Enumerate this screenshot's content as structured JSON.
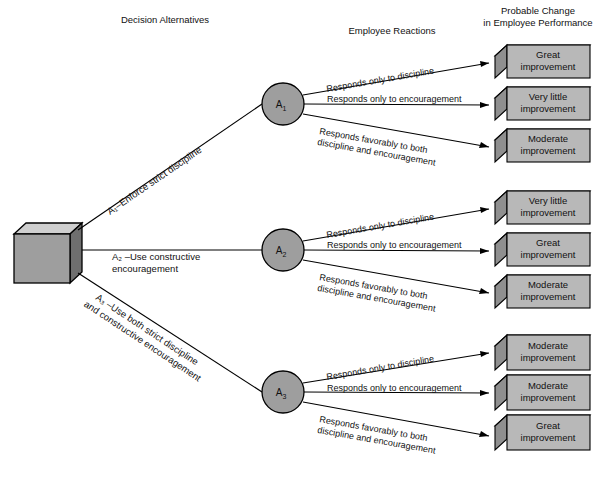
{
  "diagram": {
    "colors": {
      "box_face": "#b8b8b8",
      "box_top": "#f2f2f2",
      "box_side": "#8f8f8f",
      "node_fill": "#9e9e9e",
      "line": "#000000",
      "background": "#ffffff"
    }
  },
  "headers": {
    "decision_alternatives": "Decision Alternatives",
    "employee_reactions": "Employee Reactions",
    "probable_change_line1": "Probable Change",
    "probable_change_line2": "in Employee Performance"
  },
  "root": {
    "name": "decision-node"
  },
  "alternatives": [
    {
      "id": "A1",
      "node_label": "A",
      "node_sub": "1",
      "label_line1": "A₁–Enforce strict discipline",
      "label_line2": "",
      "reactions": [
        {
          "label_line1": "Responds only to discipline",
          "label_line2": "",
          "outcome_line1": "Great",
          "outcome_line2": "improvement"
        },
        {
          "label_line1": "Responds only to encouragement",
          "label_line2": "",
          "outcome_line1": "Very little",
          "outcome_line2": "improvement"
        },
        {
          "label_line1": "Responds favorably to both",
          "label_line2": "discipline and encouragement",
          "outcome_line1": "Moderate",
          "outcome_line2": "improvement"
        }
      ]
    },
    {
      "id": "A2",
      "node_label": "A",
      "node_sub": "2",
      "label_line1": "A₂ –Use constructive",
      "label_line2": "encouragement",
      "reactions": [
        {
          "label_line1": "Responds only to discipline",
          "label_line2": "",
          "outcome_line1": "Very little",
          "outcome_line2": "improvement"
        },
        {
          "label_line1": "Responds only to encouragement",
          "label_line2": "",
          "outcome_line1": "Great",
          "outcome_line2": "improvement"
        },
        {
          "label_line1": "Responds favorably to both",
          "label_line2": "discipline and encouragement",
          "outcome_line1": "Moderate",
          "outcome_line2": "improvement"
        }
      ]
    },
    {
      "id": "A3",
      "node_label": "A",
      "node_sub": "3",
      "label_line1": "A₃ –Use both strict discipline",
      "label_line2": "and constructive encouragement",
      "reactions": [
        {
          "label_line1": "Responds only to discipline",
          "label_line2": "",
          "outcome_line1": "Moderate",
          "outcome_line2": "improvement"
        },
        {
          "label_line1": "Responds only to encouragement",
          "label_line2": "",
          "outcome_line1": "Moderate",
          "outcome_line2": "improvement"
        },
        {
          "label_line1": "Responds favorably to both",
          "label_line2": "discipline and encouragement",
          "outcome_line1": "Great",
          "outcome_line2": "improvement"
        }
      ]
    }
  ]
}
